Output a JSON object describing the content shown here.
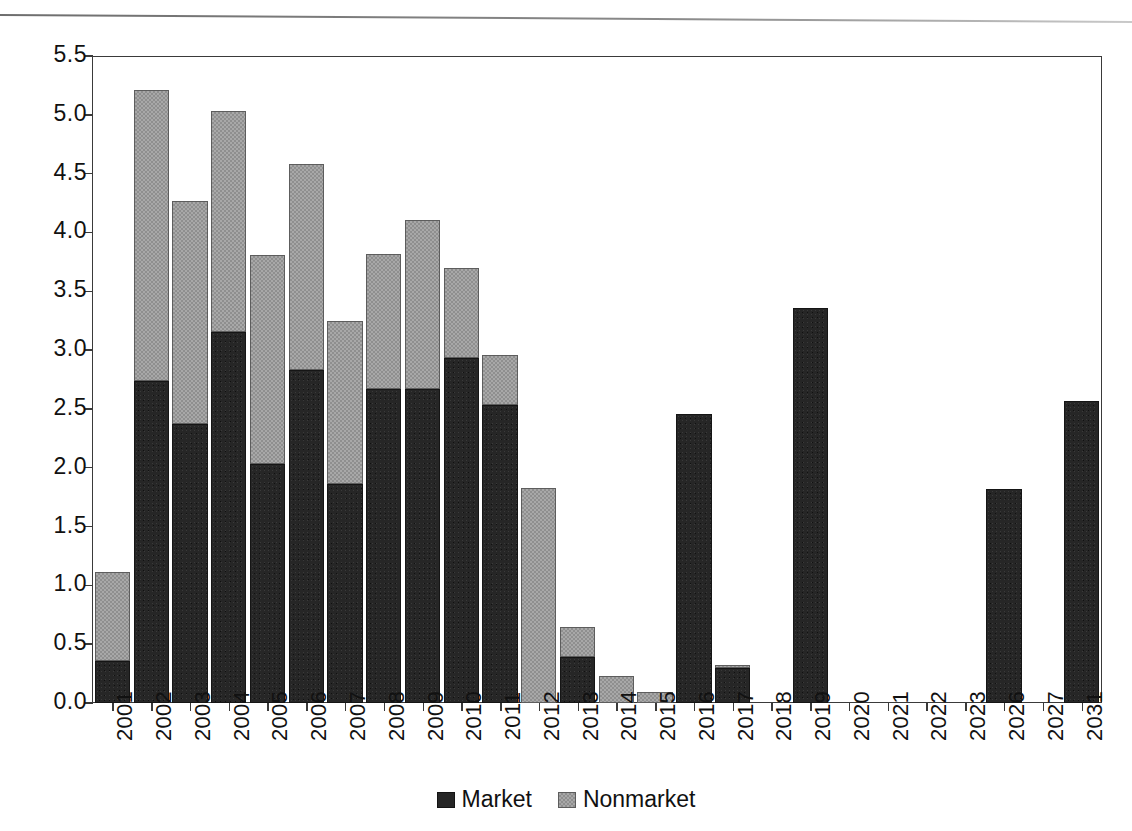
{
  "chart_data": {
    "type": "bar",
    "stacked": true,
    "title": "",
    "subtitle": "",
    "xlabel": "",
    "ylabel": "",
    "ylim": [
      0.0,
      5.5
    ],
    "yticks": [
      "0.0",
      "0.5",
      "1.0",
      "1.5",
      "2.0",
      "2.5",
      "3.0",
      "3.5",
      "4.0",
      "4.5",
      "5.0",
      "5.5"
    ],
    "grid": false,
    "legend_position": "bottom-center",
    "categories": [
      "2001",
      "2002",
      "2003",
      "2004",
      "2005",
      "2006",
      "2007",
      "2008",
      "2009",
      "2010",
      "2011",
      "2012",
      "2013",
      "2014",
      "2015",
      "2016",
      "2017",
      "2018",
      "2019",
      "2020",
      "2021",
      "2022",
      "2023",
      "2026",
      "2027",
      "2031"
    ],
    "series": [
      {
        "name": "Market",
        "color": "#262626",
        "values": [
          0.36,
          2.74,
          2.37,
          3.15,
          2.03,
          2.83,
          1.86,
          2.67,
          2.67,
          2.93,
          2.53,
          0.0,
          0.39,
          0.0,
          0.0,
          2.46,
          0.3,
          0.0,
          3.36,
          0.0,
          0.0,
          0.0,
          0.0,
          1.82,
          0.0,
          2.57
        ]
      },
      {
        "name": "Nonmarket",
        "color": "#a8a8a8",
        "values": [
          0.75,
          2.47,
          1.9,
          1.88,
          1.78,
          1.75,
          1.39,
          1.15,
          1.44,
          0.77,
          0.43,
          1.83,
          0.26,
          0.23,
          0.09,
          0.0,
          0.01,
          0.0,
          0.0,
          0.0,
          0.0,
          0.0,
          0.0,
          0.0,
          0.0,
          0.0
        ]
      }
    ],
    "totals": [
      1.11,
      5.21,
      4.27,
      5.03,
      3.81,
      4.58,
      3.25,
      3.82,
      4.11,
      3.7,
      2.96,
      1.83,
      0.65,
      0.23,
      0.09,
      2.46,
      0.31,
      0.0,
      3.36,
      0.0,
      0.0,
      0.0,
      0.0,
      1.82,
      0.0,
      2.57
    ]
  },
  "legend": {
    "items": [
      {
        "label": "Market"
      },
      {
        "label": "Nonmarket"
      }
    ]
  }
}
